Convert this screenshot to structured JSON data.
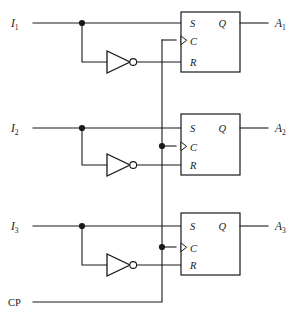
{
  "diagram": {
    "type": "digital-logic-circuit",
    "background_color": "#ffffff",
    "line_color": "#1a1a1a"
  },
  "clock": {
    "label": "CP",
    "bus_x": 162,
    "entry_y": 302
  },
  "stages": [
    {
      "id": "stage-1",
      "input_label": "I",
      "input_subscript": "1",
      "output_label": "A",
      "output_subscript": "1",
      "pins": {
        "s": "S",
        "c": "C",
        "r": "R",
        "q": "Q"
      },
      "inverter": "not-gate",
      "box": {
        "x": 181,
        "y": 12,
        "w": 59,
        "h": 60
      },
      "rows": {
        "s_y": 23,
        "c_y": 40,
        "r_y": 62
      },
      "tap_dot_x": 82,
      "clock_dot": false
    },
    {
      "id": "stage-2",
      "input_label": "I",
      "input_subscript": "2",
      "output_label": "A",
      "output_subscript": "2",
      "pins": {
        "s": "S",
        "c": "C",
        "r": "R",
        "q": "Q"
      },
      "inverter": "not-gate",
      "box": {
        "x": 181,
        "y": 114,
        "w": 59,
        "h": 61
      },
      "rows": {
        "s_y": 128,
        "c_y": 146,
        "r_y": 164
      },
      "tap_dot_x": 82,
      "clock_dot": true
    },
    {
      "id": "stage-3",
      "input_label": "I",
      "input_subscript": "3",
      "output_label": "A",
      "output_subscript": "3",
      "pins": {
        "s": "S",
        "c": "C",
        "r": "R",
        "q": "Q"
      },
      "inverter": "not-gate",
      "box": {
        "x": 181,
        "y": 213,
        "w": 59,
        "h": 62
      },
      "rows": {
        "s_y": 226,
        "c_y": 247,
        "r_y": 265
      },
      "tap_dot_x": 82,
      "clock_dot": true
    }
  ]
}
